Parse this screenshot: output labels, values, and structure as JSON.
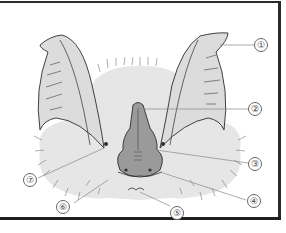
{
  "figure": {
    "colors": {
      "ear_fill": "#dcdcdc",
      "fur_fill": "#e6e6e6",
      "noseleaf_fill": "#9a9a9a",
      "outline": "#2e2e2e",
      "leader_line": "#888888",
      "frame": "#2a2a2a"
    },
    "callouts": [
      {
        "id": "1",
        "label": "①"
      },
      {
        "id": "2",
        "label": "②"
      },
      {
        "id": "3",
        "label": "③"
      },
      {
        "id": "4",
        "label": "④"
      },
      {
        "id": "5",
        "label": "⑤"
      },
      {
        "id": "6",
        "label": "⑥"
      },
      {
        "id": "7",
        "label": "⑦"
      }
    ]
  }
}
